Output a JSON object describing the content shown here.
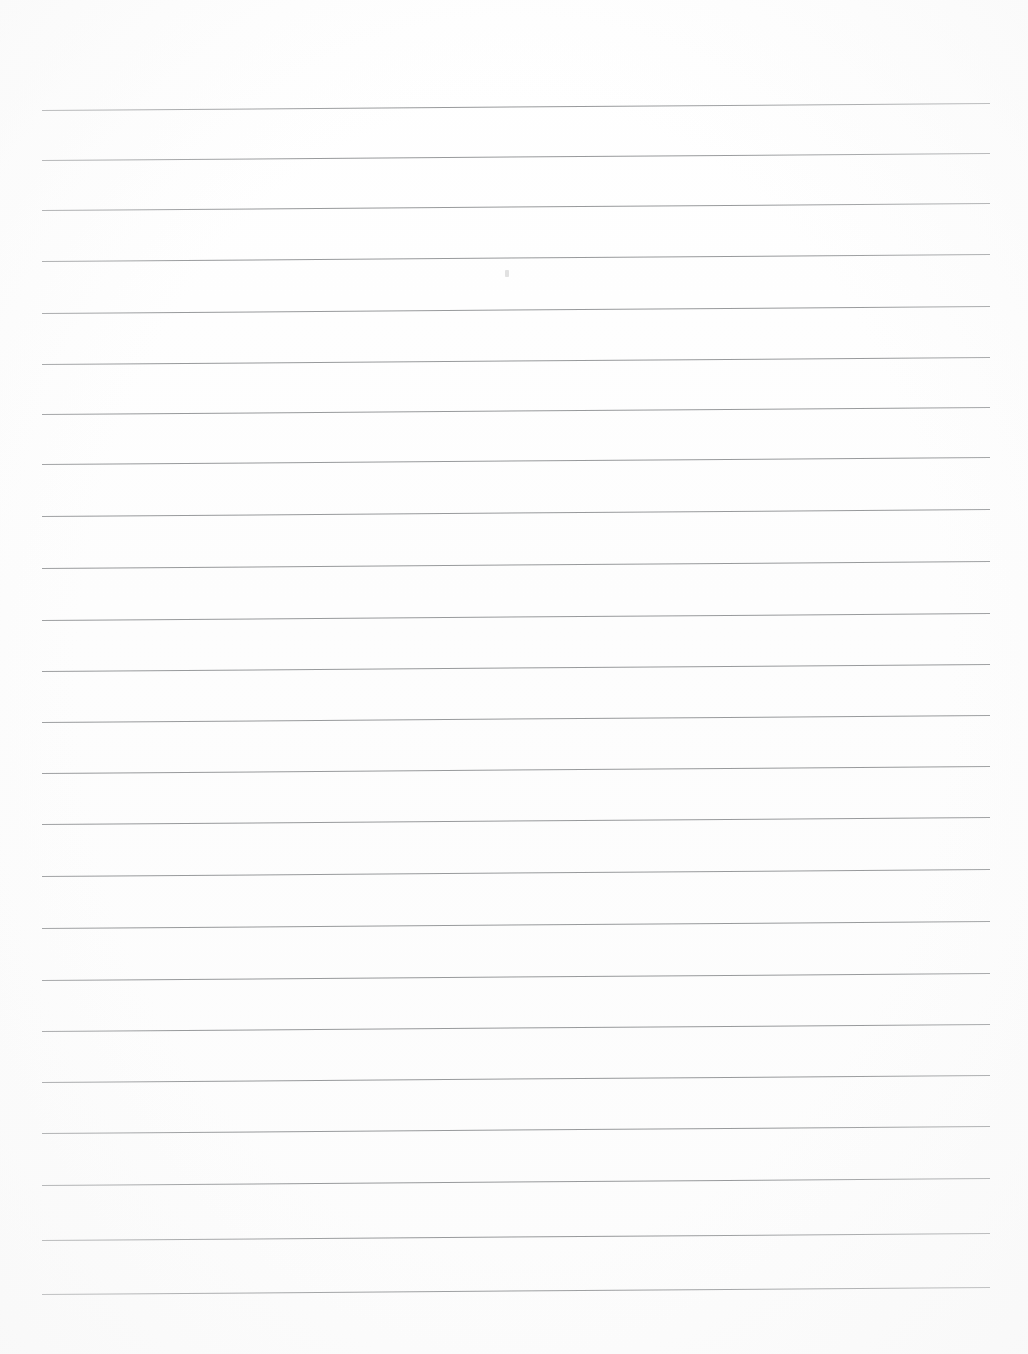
{
  "document": {
    "kind": "scanned-lined-paper",
    "title": "Blank Ruled Notebook Page",
    "content_text": "",
    "page_width": 1028,
    "page_height": 1354,
    "background_color": "#fefefe",
    "is_blank": "true"
  },
  "ruling": {
    "line_color": "#8f9194",
    "line_thickness_px": 1,
    "line_count": 24,
    "line_spacing_px": 50,
    "first_line_y": 110,
    "left_margin_x": 42,
    "right_margin_x": 990,
    "line_length_px": 948,
    "skew_degrees": -0.42,
    "lines": [
      {
        "index": 1,
        "y": 110
      },
      {
        "index": 2,
        "y": 160
      },
      {
        "index": 3,
        "y": 210
      },
      {
        "index": 4,
        "y": 261
      },
      {
        "index": 5,
        "y": 313
      },
      {
        "index": 6,
        "y": 364
      },
      {
        "index": 7,
        "y": 414
      },
      {
        "index": 8,
        "y": 464
      },
      {
        "index": 9,
        "y": 516
      },
      {
        "index": 10,
        "y": 568
      },
      {
        "index": 11,
        "y": 620
      },
      {
        "index": 12,
        "y": 671
      },
      {
        "index": 13,
        "y": 722
      },
      {
        "index": 14,
        "y": 773
      },
      {
        "index": 15,
        "y": 824
      },
      {
        "index": 16,
        "y": 876
      },
      {
        "index": 17,
        "y": 928
      },
      {
        "index": 18,
        "y": 980
      },
      {
        "index": 19,
        "y": 1031
      },
      {
        "index": 20,
        "y": 1082
      },
      {
        "index": 21,
        "y": 1133
      },
      {
        "index": 22,
        "y": 1185
      },
      {
        "index": 23,
        "y": 1240
      },
      {
        "index": 24,
        "y": 1294
      }
    ]
  },
  "artifacts": {
    "speck": {
      "label": "faint-scan-speck",
      "x": 505,
      "y": 270,
      "color": "#c9c9c9"
    }
  },
  "margins": {
    "top_blank_px": 110,
    "bottom_blank_px": 58,
    "left_blank_px": 42,
    "right_blank_px": 38
  }
}
